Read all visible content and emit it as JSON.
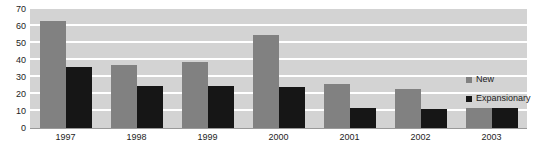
{
  "chart_data": {
    "type": "bar",
    "title": "",
    "xlabel": "",
    "ylabel": "",
    "categories": [
      "1997",
      "1998",
      "1999",
      "2000",
      "2001",
      "2002",
      "2003"
    ],
    "series": [
      {
        "name": "New",
        "color": "#818181",
        "values": [
          63,
          37,
          39,
          55,
          26,
          23,
          12
        ]
      },
      {
        "name": "Expansionary",
        "color": "#161616",
        "values": [
          36,
          25,
          25,
          24,
          12,
          11,
          12
        ]
      }
    ],
    "ylim": [
      0,
      70
    ],
    "yticks": [
      0,
      10,
      20,
      30,
      40,
      50,
      60,
      70
    ],
    "ytick_labels": [
      "0",
      "10",
      "20",
      "30",
      "40",
      "50",
      "60",
      "70"
    ],
    "grid": true,
    "grid_color": "#ffffff",
    "plot_background": "#d3d3d3",
    "legend_position": "right"
  },
  "legend": {
    "items": [
      {
        "label": "New",
        "swatch_icon": "square-swatch-icon"
      },
      {
        "label": "Expansionary",
        "swatch_icon": "square-swatch-icon"
      }
    ]
  }
}
